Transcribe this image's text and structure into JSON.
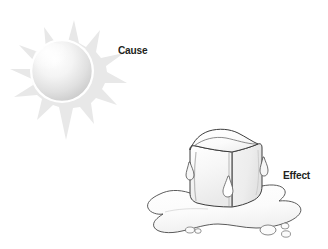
{
  "figure": {
    "background_color": "#ffffff",
    "label_color": "#231f20"
  },
  "labels": {
    "cause": "Cause",
    "effect": "Effect"
  },
  "illustrations": [
    {
      "name": "sun",
      "role": "cause",
      "description": "Sun with shaded sphere and pointed rays",
      "ray_count": 12,
      "fill_color": "#e9e9e9",
      "sphere_colors": [
        "#ffffff",
        "#e3e3e3",
        "#c9c9c9"
      ]
    },
    {
      "name": "melting-ice-cube",
      "role": "effect",
      "description": "Ice cube melting into a puddle with drips and droplets",
      "outline_color": "#3b3b3b",
      "fill_color": "#fafafa",
      "droplet_count": 5
    }
  ]
}
